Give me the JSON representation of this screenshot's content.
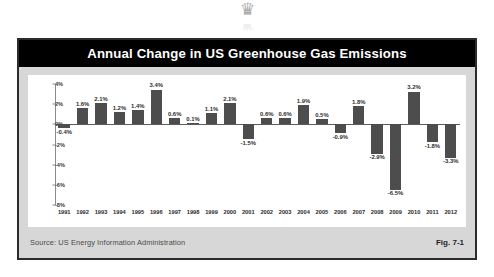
{
  "watermark": {
    "glyph": "♛",
    "name": "logo-watermark"
  },
  "figure": {
    "title": "Annual Change in US Greenhouse Gas Emissions",
    "source": "Source:  US Energy Information Administration",
    "fig_label": "Fig. 7-1"
  },
  "chart_data": {
    "type": "bar",
    "title": "Annual Change in US Greenhouse Gas Emissions",
    "xlabel": "",
    "ylabel": "",
    "ylim": [
      -8,
      4
    ],
    "yticks": [
      4,
      2,
      0,
      -2,
      -4,
      -6,
      -8
    ],
    "ytick_labels": [
      "4%",
      "2%",
      "0%",
      "-2%",
      "-4%",
      "-6%",
      "-8%"
    ],
    "grid": false,
    "legend": null,
    "units": "percent",
    "categories": [
      "1991",
      "1992",
      "1993",
      "1994",
      "1995",
      "1996",
      "1997",
      "1998",
      "1999",
      "2000",
      "2001",
      "2002",
      "2003",
      "2004",
      "2005",
      "2006",
      "2007",
      "2008",
      "2009",
      "2010",
      "2011",
      "2012"
    ],
    "values": [
      -0.4,
      1.6,
      2.1,
      1.2,
      1.4,
      3.4,
      0.6,
      0.1,
      1.1,
      2.1,
      -1.5,
      0.6,
      0.6,
      1.9,
      0.5,
      -0.9,
      1.8,
      -2.9,
      -6.5,
      3.2,
      -1.8,
      -3.3
    ],
    "data_labels": [
      "-0.4%",
      "1.6%",
      "2.1%",
      "1.2%",
      "1.4%",
      "3.4%",
      "0.6%",
      "0.1%",
      "1.1%",
      "2.1%",
      "-1.5%",
      "0.6%",
      "0.6%",
      "1.9%",
      "0.5%",
      "-0.9%",
      "1.8%",
      "-2.9%",
      "-6.5%",
      "3.2%",
      "-1.8%",
      "-3.3%"
    ],
    "bar_color": "#4d4d4d",
    "plot_background": "#ffffff",
    "panel_background": "#d7d7d7",
    "title_background": "#000000",
    "title_color": "#ffffff"
  }
}
